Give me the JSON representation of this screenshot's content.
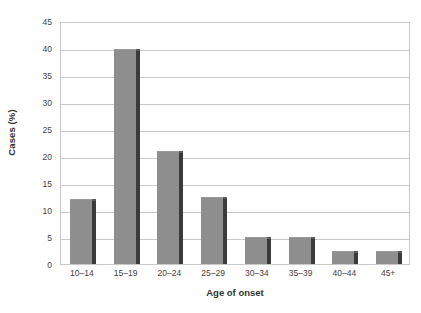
{
  "chart_data": {
    "type": "bar",
    "title": "",
    "subtitle": "",
    "xlabel": "Age of onset",
    "ylabel": "Cases (%)",
    "categories": [
      "10–14",
      "15–19",
      "20–24",
      "25–29",
      "30–34",
      "35–39",
      "40–44",
      "45+"
    ],
    "values": [
      12,
      39.8,
      21,
      12.5,
      5,
      5,
      2.5,
      2.5
    ],
    "ylim": [
      0,
      45
    ],
    "ytick_labels": [
      "0",
      "5",
      "10",
      "15",
      "20",
      "25",
      "30",
      "35",
      "40",
      "45"
    ],
    "ytick_values": [
      0,
      5,
      10,
      15,
      20,
      25,
      30,
      35,
      40,
      45
    ],
    "grid": "horizontal",
    "legend": "none",
    "series": [
      {
        "name": "Cases (%)",
        "values": [
          12,
          39.8,
          21,
          12.5,
          5,
          5,
          2.5,
          2.5
        ]
      }
    ],
    "colors": {
      "bar_fill": "#8e8e8e",
      "bar_shadow": "#3a3a3a",
      "gridline": "#c9c9c9",
      "axis_border": "#c9c9c9",
      "background": "#ffffff",
      "text": "#333333"
    }
  }
}
